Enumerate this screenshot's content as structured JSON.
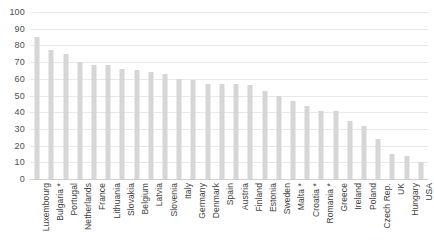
{
  "chart_data": {
    "type": "bar",
    "title": "",
    "subtitle": "",
    "xlabel": "",
    "ylabel": "",
    "ylim": [
      0,
      100
    ],
    "ytick_step": 10,
    "yticks": [
      "100",
      "90",
      "80",
      "70",
      "60",
      "50",
      "40",
      "30",
      "20",
      "10",
      "0"
    ],
    "grid": true,
    "legend": "none",
    "bar_color": "#d6d6d6",
    "categories": [
      "Luxembourg",
      "Bulgaria *",
      "Portugal",
      "Netherlands",
      "France",
      "Lithuania",
      "Slovakia",
      "Belgium",
      "Latvia",
      "Slovenia",
      "Italy",
      "Germany",
      "Denmark",
      "Spain",
      "Austria",
      "Finland",
      "Estonia",
      "Sweden",
      "Malta *",
      "Croatia *",
      "Romania *",
      "Greece",
      "Ireland",
      "Poland",
      "Czech Rep.",
      "UK",
      "Hungary",
      "USA"
    ],
    "values": [
      85,
      77,
      75,
      70,
      68,
      68,
      66,
      65,
      64,
      63,
      60,
      59,
      57,
      57,
      57,
      56,
      53,
      50,
      47,
      44,
      41,
      41,
      35,
      32,
      24,
      15,
      14,
      10
    ]
  },
  "axis": {
    "y_max_label": "100",
    "y_min_label": "0"
  },
  "footnote_marker": "*"
}
